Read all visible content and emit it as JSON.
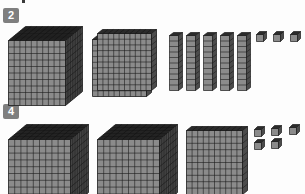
{
  "page": {
    "background_color": "#fdfdfd",
    "width": 305,
    "height": 194
  },
  "palette": {
    "badge_fill": "#7f7f7f",
    "badge_text": "#ffffff",
    "block_front": "#8b8b8b",
    "block_top": "#2b2b2b",
    "block_side": "#4b4b4b",
    "grid_line": "#1c1c1c"
  },
  "problems": [
    {
      "number": "2",
      "badge_label": "2",
      "groups": [
        {
          "place": "thousands",
          "piece": "cube",
          "count": 1,
          "unit_value": 1000
        },
        {
          "place": "hundreds",
          "piece": "flat",
          "count": 2,
          "unit_value": 100
        },
        {
          "place": "tens",
          "piece": "rod",
          "count": 5,
          "unit_value": 10
        },
        {
          "place": "ones",
          "piece": "unit",
          "count": 3,
          "unit_value": 1
        }
      ],
      "total_value": "1253"
    },
    {
      "number": "4",
      "badge_label": "4",
      "groups": [
        {
          "place": "thousands",
          "piece": "cube",
          "count": 2,
          "unit_value": 1000
        },
        {
          "place": "hundreds",
          "piece": "flat",
          "count": 1,
          "unit_value": 100
        },
        {
          "place": "tens",
          "piece": "rod",
          "count": 0,
          "unit_value": 10
        },
        {
          "place": "ones",
          "piece": "unit",
          "count": 5,
          "unit_value": 1
        }
      ],
      "total_value": "2105"
    }
  ]
}
